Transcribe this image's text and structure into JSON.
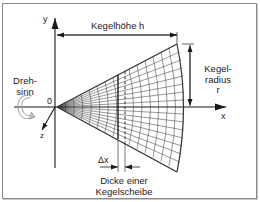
{
  "diagram": {
    "axes": {
      "y_label": "y",
      "x_label": "x",
      "z_label": "z",
      "origin_label": "0"
    },
    "labels": {
      "height": "Kegelhöhe h",
      "radius_line1": "Kegel-",
      "radius_line2": "radius",
      "radius_line3": "r",
      "rotation_line1": "Dreh-",
      "rotation_line2": "sinn",
      "delta_x": "Δx",
      "slice_line1": "Dicke einer",
      "slice_line2": "Kegelscheibe"
    },
    "colors": {
      "line": "#1a1a1a",
      "mesh": "#333333",
      "frame": "#8a8a8a",
      "rotation_arrow": "#9a9a9a"
    }
  }
}
